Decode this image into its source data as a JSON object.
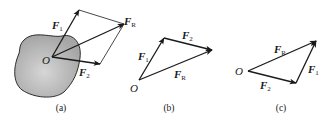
{
  "figure": {
    "panels": [
      {
        "id": "a",
        "caption": "(a)",
        "origin_label": "O",
        "vectors": [
          {
            "name": "F",
            "sub": "1"
          },
          {
            "name": "F",
            "sub": "2"
          },
          {
            "name": "F",
            "sub": "R"
          }
        ],
        "description": "Parallelogram rule: forces F1 and F2 acting at point O on a rigid body, resultant FR along diagonal"
      },
      {
        "id": "b",
        "caption": "(b)",
        "origin_label": "O",
        "vectors": [
          {
            "name": "F",
            "sub": "1"
          },
          {
            "name": "F",
            "sub": "2"
          },
          {
            "name": "F",
            "sub": "R"
          }
        ],
        "description": "Force triangle: F1 then F2 head-to-tail, FR closes the triangle"
      },
      {
        "id": "c",
        "caption": "(c)",
        "origin_label": "O",
        "vectors": [
          {
            "name": "F",
            "sub": "R"
          },
          {
            "name": "F",
            "sub": "2"
          },
          {
            "name": "F",
            "sub": "1"
          }
        ],
        "description": "Force triangle: F2 then F1 head-to-tail, FR closes the triangle"
      }
    ],
    "colors": {
      "line": "#1a1a1a",
      "body_fill": "#b8b8b8",
      "background": "#ffffff"
    }
  }
}
